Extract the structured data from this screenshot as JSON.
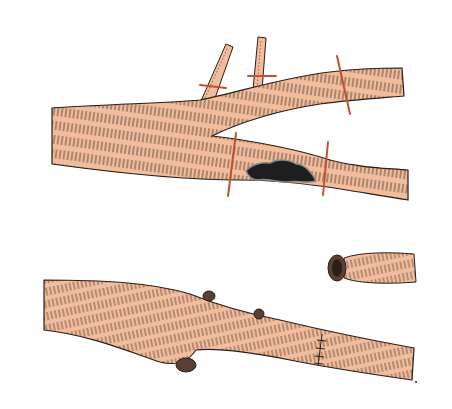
{
  "figure": {
    "background": "#ffffff",
    "colors": {
      "vessel_fill": "#f2bd9c",
      "vessel_outline": "#2a1e18",
      "hatching": "#3a2a22",
      "ligature": "#c0503a",
      "lesion": "#1e1e1e",
      "lesion_edge": "#8a8a8a",
      "stump": "#5a4034"
    },
    "panels": [
      {
        "name": "top",
        "description": "Bifurcating vessel with two small branches tied off and ligatures placed above and below a dark lesion on the lower limb",
        "elements": [
          "main-trunk",
          "upper-branch",
          "lower-branch",
          "small-branch-1",
          "small-branch-2",
          "ligature-x4",
          "lesion"
        ]
      },
      {
        "name": "bottom",
        "description": "Repaired vessel with tied-off branch stumps and a sutured anastomosis; separate excised vessel segment at upper right",
        "elements": [
          "repaired-vessel",
          "stump-x3",
          "suture-line",
          "excised-segment"
        ]
      }
    ]
  }
}
